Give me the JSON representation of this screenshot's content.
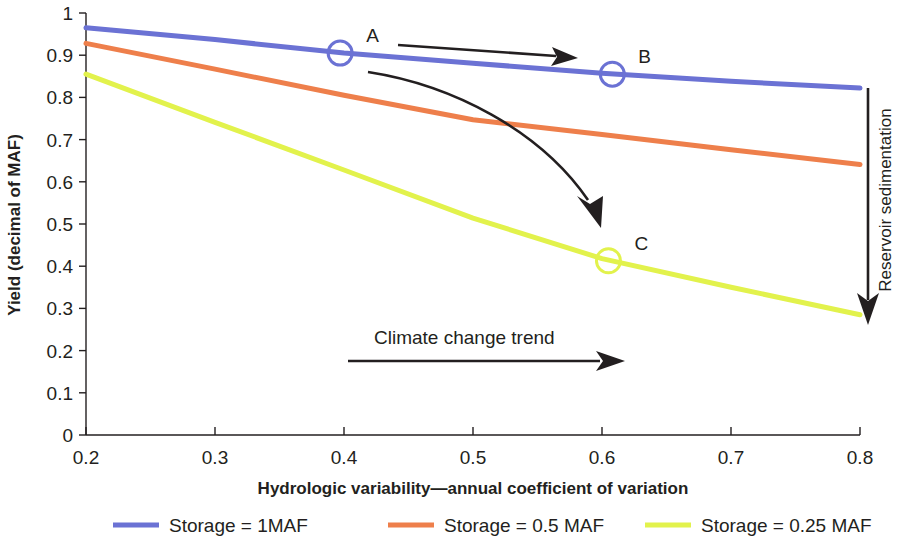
{
  "chart_data": {
    "type": "line",
    "title": "",
    "xlabel": "Hydrologic variability—annual coefficient of variation",
    "ylabel": "Yield (decimal of MAF)",
    "xlim": [
      0.2,
      0.8
    ],
    "ylim": [
      0,
      1
    ],
    "grid": false,
    "legend_position": "bottom",
    "xticks": [
      "0.2",
      "0.3",
      "0.4",
      "0.5",
      "0.6",
      "0.7",
      "0.8"
    ],
    "xtick_values": [
      0.2,
      0.3,
      0.4,
      0.5,
      0.6,
      0.7,
      0.8
    ],
    "yticks": [
      "0",
      "0.1",
      "0.2",
      "0.3",
      "0.4",
      "0.5",
      "0.6",
      "0.7",
      "0.8",
      "0.9",
      "1"
    ],
    "ytick_values": [
      0,
      0.1,
      0.2,
      0.3,
      0.4,
      0.5,
      0.6,
      0.7,
      0.8,
      0.9,
      1
    ],
    "series": [
      {
        "name": "Storage = 1MAF",
        "color": "#6b72d4",
        "x": [
          0.2,
          0.3,
          0.4,
          0.5,
          0.6,
          0.7,
          0.8
        ],
        "values": [
          0.965,
          0.937,
          0.905,
          0.881,
          0.857,
          0.838,
          0.822
        ]
      },
      {
        "name": "Storage = 0.5 MAF",
        "color": "#ee7f4b",
        "x": [
          0.2,
          0.3,
          0.4,
          0.5,
          0.6,
          0.7,
          0.8
        ],
        "values": [
          0.928,
          0.867,
          0.805,
          0.747,
          0.712,
          0.676,
          0.641
        ]
      },
      {
        "name": "Storage = 0.25 MAF",
        "color": "#e2f24c",
        "x": [
          0.2,
          0.3,
          0.4,
          0.5,
          0.6,
          0.7,
          0.8
        ],
        "values": [
          0.855,
          0.741,
          0.628,
          0.514,
          0.418,
          0.35,
          0.285
        ]
      }
    ],
    "annotations": [
      {
        "label": "A",
        "x": 0.397,
        "y": 0.905,
        "series": "Storage = 1MAF",
        "marker": "circle"
      },
      {
        "label": "B",
        "x": 0.608,
        "y": 0.855,
        "series": "Storage = 1MAF",
        "marker": "circle"
      },
      {
        "label": "C",
        "x": 0.605,
        "y": 0.413,
        "series": "Storage = 0.25 MAF",
        "marker": "circle"
      }
    ],
    "arrow_annotations": [
      {
        "label": "Climate change trend",
        "direction": "right"
      },
      {
        "label": "Reservoir sedimentation",
        "direction": "down"
      },
      {
        "label": "",
        "direction": "right",
        "note": "A to B arrow"
      },
      {
        "label": "",
        "direction": "down-right-curved",
        "note": "A to C arrow"
      }
    ]
  },
  "axis": {
    "x_title": "Hydrologic variability—annual coefficient of variation",
    "y_title": "Yield (decimal of MAF)"
  },
  "markers": {
    "a": "A",
    "b": "B",
    "c": "C"
  },
  "trend": {
    "climate_label": "Climate change trend",
    "sedimentation_label": "Reservoir sedimentation"
  },
  "legend": {
    "items": [
      {
        "label": "Storage = 1MAF",
        "color": "#6b72d4"
      },
      {
        "label": "Storage = 0.5 MAF",
        "color": "#ee7f4b"
      },
      {
        "label": "Storage = 0.25 MAF",
        "color": "#e2f24c"
      }
    ]
  },
  "colors": {
    "axis": "#231f20",
    "text": "#231f20",
    "series_1": "#6b72d4",
    "series_2": "#ee7f4b",
    "series_3": "#e2f24c"
  }
}
